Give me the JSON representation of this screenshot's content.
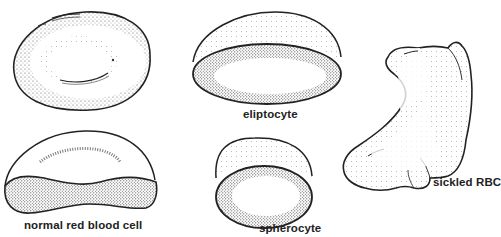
{
  "figure": {
    "type": "scientific illustration",
    "colors": {
      "background": "#ffffff",
      "ink": "#222222",
      "stipple": "#555555"
    }
  },
  "cells": [
    {
      "id": "normal-top",
      "label": ""
    },
    {
      "id": "eliptocyte",
      "label": "eliptocyte"
    },
    {
      "id": "sickled",
      "label": "sickled RBC"
    },
    {
      "id": "normal-section",
      "label": "normal red blood cell"
    },
    {
      "id": "spherocyte",
      "label": "spherocyte"
    }
  ]
}
